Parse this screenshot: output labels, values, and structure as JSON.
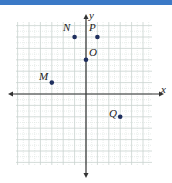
{
  "colors": {
    "topbar": "#3b79c6",
    "grid_major": "#c9d3cf",
    "grid_minor": "#dfe6e3",
    "axis": "#333333",
    "point": "#1f2f5e"
  },
  "axes": {
    "x_label": "x",
    "y_label": "y"
  },
  "points": [
    {
      "label": "N",
      "x": -1,
      "y": 5
    },
    {
      "label": "P",
      "x": 1,
      "y": 5
    },
    {
      "label": "O",
      "x": 0,
      "y": 3
    },
    {
      "label": "M",
      "x": -3,
      "y": 1
    },
    {
      "label": "Q",
      "x": 3,
      "y": -2
    }
  ]
}
